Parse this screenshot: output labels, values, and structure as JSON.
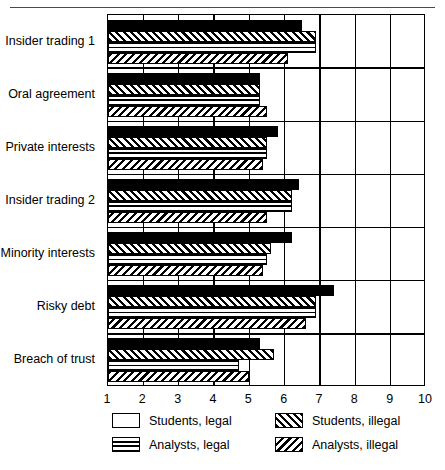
{
  "chart_data": {
    "type": "bar",
    "orientation": "horizontal",
    "title": "",
    "xlabel": "",
    "ylabel": "",
    "xlim": [
      1,
      10
    ],
    "xticks": [
      1,
      2,
      3,
      4,
      5,
      6,
      7,
      8,
      9,
      10
    ],
    "grid": true,
    "grid_axis": "x",
    "legend_position": "bottom",
    "categories": [
      "Insider trading 1",
      "Oral agreement",
      "Private interests",
      "Insider trading 2",
      "Minority interests",
      "Risky debt",
      "Breach of trust"
    ],
    "series": [
      {
        "name": "Students, legal",
        "pattern": "solid-black",
        "values": [
          6.5,
          5.3,
          5.8,
          6.4,
          6.2,
          7.4,
          5.3
        ]
      },
      {
        "name": "Students, illegal",
        "pattern": "diagonal-right-hatch",
        "values": [
          6.9,
          5.3,
          5.5,
          6.2,
          5.6,
          6.9,
          5.7
        ]
      },
      {
        "name": "Analysts, legal",
        "pattern": "cross-grid-hatch",
        "values": [
          6.9,
          5.3,
          5.5,
          6.2,
          5.5,
          6.9,
          4.7
        ]
      },
      {
        "name": "Analysts, illegal",
        "pattern": "diagonal-left-hatch",
        "values": [
          6.1,
          5.5,
          5.4,
          5.5,
          5.4,
          6.6,
          5.0
        ]
      }
    ]
  },
  "legend": {
    "entries": [
      {
        "label": "Students, legal",
        "pattern": "solid-black"
      },
      {
        "label": "Students, illegal",
        "pattern": "diagonal-right-hatch"
      },
      {
        "label": "Analysts, legal",
        "pattern": "cross-grid-hatch"
      },
      {
        "label": "Analysts, illegal",
        "pattern": "diagonal-left-hatch"
      }
    ]
  },
  "colors": {
    "foreground": "#000000",
    "background": "#ffffff",
    "rule": "#4a4a4a"
  }
}
